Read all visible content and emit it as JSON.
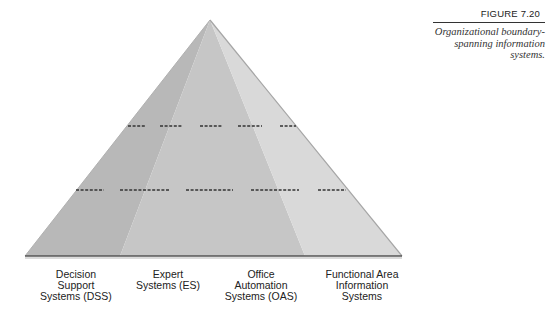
{
  "figure": {
    "number": "FIGURE 7.20",
    "caption_line1": "Organizational boundary-",
    "caption_line2": "spanning information systems."
  },
  "pyramid": {
    "apex": [
      210,
      20
    ],
    "base_left": [
      25,
      256
    ],
    "base_right": [
      402,
      256
    ],
    "facet_base_points": [
      120,
      305
    ],
    "colors": {
      "left_face": "#b9b9b9",
      "center_face": "#c8c8c8",
      "right_face": "#dadada",
      "base_line": "#555555",
      "dashes": "#333333"
    },
    "level_lines_y": [
      126,
      190
    ]
  },
  "labels": [
    {
      "line1": "Decision",
      "line2": "Support",
      "line3": "Systems (DSS)"
    },
    {
      "line1": "Expert",
      "line2": "Systems (ES)",
      "line3": ""
    },
    {
      "line1": "Office",
      "line2": "Automation",
      "line3": "Systems (OAS)"
    },
    {
      "line1": "Functional Area",
      "line2": "Information",
      "line3": "Systems"
    }
  ]
}
